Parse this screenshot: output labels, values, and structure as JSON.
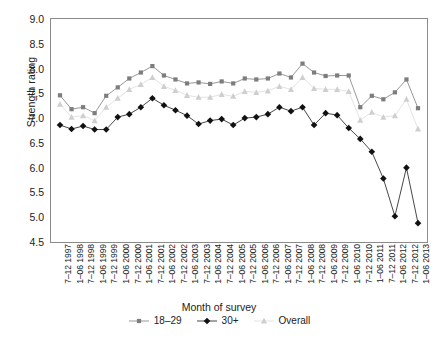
{
  "chart_data": {
    "type": "line",
    "title": "",
    "xlabel": "Month of survey",
    "ylabel": "Strength rating",
    "ylim": [
      4.5,
      9.0
    ],
    "ytick_step": 0.5,
    "grid": false,
    "legend_position": "bottom",
    "yticks": [
      "9.0",
      "8.5",
      "8.0",
      "7.5",
      "7.0",
      "6.5",
      "6.0",
      "5.5",
      "5.0",
      "4.5"
    ],
    "categories": [
      "7–12 1997",
      "1–06 1998",
      "7–12 1998",
      "1–06 1999",
      "7–12 1999",
      "1–06 2000",
      "7–12 2000",
      "1–06 2001",
      "7–12 2001",
      "1–06 2002",
      "7–12 2002",
      "1–06 2003",
      "7–12 2003",
      "1–06 2004",
      "7–12 2004",
      "1–06 2005",
      "7–12 2005",
      "1–06 2006",
      "7–12 2006",
      "1–06 2007",
      "7–12 2007",
      "1–06 2008",
      "7–12 2008",
      "1–06 2009",
      "7–12 2009",
      "1–06 2010",
      "7–12 2010",
      "1–06 2011",
      "7–12 2011",
      "1–06 2012",
      "7–12 2012",
      "1–06 2013"
    ],
    "series": [
      {
        "name": "18–29",
        "marker": "square",
        "color": "#7d7d7d",
        "line_color": "#8c8c8c",
        "values": [
          7.46,
          7.18,
          7.22,
          7.1,
          7.45,
          7.62,
          7.8,
          7.92,
          8.05,
          7.86,
          7.78,
          7.7,
          7.72,
          7.69,
          7.74,
          7.7,
          7.8,
          7.78,
          7.8,
          7.9,
          7.82,
          8.1,
          7.92,
          7.85,
          7.86,
          7.86,
          7.22,
          7.45,
          7.38,
          7.52,
          7.78,
          7.2
        ]
      },
      {
        "name": "30+",
        "marker": "diamond",
        "color": "#111111",
        "line_color": "#333333",
        "values": [
          6.86,
          6.78,
          6.84,
          6.77,
          6.77,
          7.02,
          7.08,
          7.22,
          7.4,
          7.26,
          7.16,
          7.05,
          6.88,
          6.95,
          6.98,
          6.86,
          7.0,
          7.02,
          7.08,
          7.22,
          7.14,
          7.22,
          6.86,
          7.1,
          7.06,
          6.8,
          6.58,
          6.32,
          5.78,
          5.02,
          6.0,
          4.88
        ]
      },
      {
        "name": "Overall",
        "marker": "triangle",
        "color": "#cfcfcf",
        "line_color": "#e0e0e0",
        "values": [
          7.28,
          7.02,
          7.05,
          6.95,
          7.22,
          7.4,
          7.58,
          7.68,
          7.82,
          7.64,
          7.56,
          7.46,
          7.42,
          7.42,
          7.48,
          7.44,
          7.54,
          7.52,
          7.55,
          7.64,
          7.58,
          7.82,
          7.6,
          7.58,
          7.58,
          7.54,
          6.96,
          7.12,
          7.02,
          7.05,
          7.38,
          6.78
        ]
      }
    ]
  },
  "legend": {
    "entries": [
      {
        "label": "18–29"
      },
      {
        "label": "30+"
      },
      {
        "label": "Overall"
      }
    ]
  },
  "caption": {
    "text": ""
  }
}
